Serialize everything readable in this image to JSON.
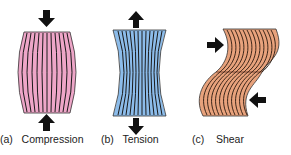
{
  "panels": [
    {
      "letter": "(a)",
      "name": "Compression",
      "fill": "#eea6c8"
    },
    {
      "letter": "(b)",
      "name": "Tension",
      "fill": "#8cbcea"
    },
    {
      "letter": "(c)",
      "name": "Shear",
      "fill": "#e8a27c"
    }
  ],
  "colors": {
    "arrow": "#111111",
    "lines": "#1a1a1a"
  }
}
